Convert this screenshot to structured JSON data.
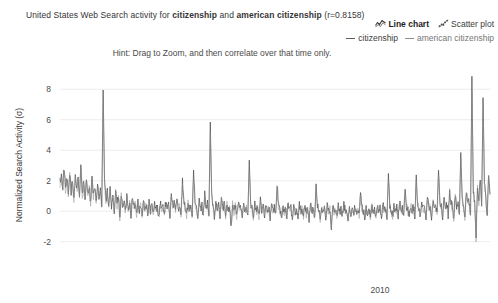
{
  "header": {
    "title_prefix": "United States Web Search activity for ",
    "term_a": "citizenship",
    "title_join": " and ",
    "term_b": "american citizenship",
    "correlation_text": " (r=0.8158)",
    "hint": "Hint: Drag to Zoom, and then correlate over that time only."
  },
  "view_toggle": {
    "line_chart_label": "Line chart",
    "line_chart_icon": "line-chart-icon",
    "scatter_plot_label": "Scatter plot",
    "scatter_plot_icon": "scatter-plot-icon",
    "active": "Line chart"
  },
  "legend": {
    "entries": [
      {
        "label": "citizenship",
        "color": "#5c5c5c"
      },
      {
        "label": "american citizenship",
        "color": "#8f8f8f"
      }
    ]
  },
  "chart_data": {
    "type": "line",
    "title": "United States Web Search activity for citizenship and american citizenship (r=0.8158)",
    "xlabel": "",
    "ylabel": "Normalized Search Activity (σ)",
    "grid": true,
    "legend_position": "top-right",
    "correlation_r": 0.8158,
    "ylim": [
      -3.2,
      9.0
    ],
    "ytick_values": [
      8,
      6,
      4,
      2,
      0,
      -2
    ],
    "ytick_labels": [
      "8",
      "6",
      "4",
      "2",
      "0",
      "-2"
    ],
    "xtick_values": [
      2010
    ],
    "xtick_labels": [
      "2010"
    ],
    "xlim": [
      2003.6,
      2012.2
    ],
    "series": [
      {
        "name": "citizenship",
        "color": "#4a4a4a",
        "values": [
          1.95,
          2.35,
          1.62,
          2.9,
          1.4,
          2.15,
          1.05,
          2.55,
          1.3,
          2.0,
          0.85,
          2.45,
          1.5,
          2.1,
          0.95,
          3.05,
          1.25,
          1.85,
          0.7,
          2.3,
          1.1,
          1.7,
          0.55,
          2.25,
          1.0,
          1.55,
          0.45,
          1.9,
          0.8,
          1.45,
          0.3,
          7.95,
          2.2,
          0.6,
          1.35,
          0.15,
          1.6,
          0.4,
          1.15,
          -0.2,
          1.45,
          0.5,
          0.95,
          -0.45,
          1.05,
          0.25,
          0.75,
          -0.15,
          0.9,
          0.1,
          0.6,
          -0.3,
          0.85,
          0.2,
          0.5,
          -0.1,
          0.7,
          0.0,
          0.45,
          -0.35,
          0.65,
          0.15,
          0.4,
          -0.25,
          0.55,
          0.05,
          0.35,
          -0.2,
          0.5,
          0.1,
          0.3,
          -0.4,
          0.6,
          0.2,
          0.35,
          -0.15,
          0.55,
          0.05,
          0.4,
          -0.3,
          1.25,
          0.35,
          0.55,
          0.0,
          0.75,
          0.15,
          0.45,
          -0.2,
          1.95,
          0.5,
          0.3,
          -0.35,
          0.6,
          0.1,
          0.4,
          -0.25,
          2.65,
          0.55,
          0.2,
          -0.45,
          0.7,
          0.15,
          0.35,
          -0.2,
          1.15,
          0.3,
          0.5,
          -0.3,
          5.85,
          1.05,
          0.25,
          -0.5,
          0.6,
          0.05,
          0.4,
          -0.35,
          0.85,
          0.2,
          0.45,
          -0.25,
          0.65,
          0.1,
          0.3,
          -1.15,
          0.5,
          0.0,
          0.35,
          -0.3,
          0.55,
          0.15,
          0.25,
          -0.45,
          0.6,
          0.05,
          0.3,
          -0.25,
          3.35,
          0.6,
          0.15,
          -0.4,
          0.45,
          0.0,
          0.25,
          -0.3,
          0.7,
          0.1,
          0.35,
          -0.2,
          0.5,
          -0.05,
          0.3,
          -0.55,
          0.45,
          0.05,
          0.2,
          -0.35,
          1.85,
          0.4,
          0.1,
          -0.45,
          0.35,
          -0.1,
          0.25,
          -0.3,
          0.55,
          0.0,
          0.2,
          -0.55,
          0.4,
          -0.05,
          0.15,
          -0.4,
          0.5,
          0.05,
          0.2,
          -0.3,
          0.35,
          -0.15,
          0.25,
          -0.5,
          0.45,
          0.0,
          0.15,
          -0.35,
          1.55,
          0.3,
          0.05,
          -0.45,
          0.3,
          -0.1,
          0.2,
          -0.35,
          0.4,
          -0.05,
          0.15,
          -1.35,
          0.35,
          0.0,
          0.1,
          -0.4,
          0.3,
          -0.1,
          0.2,
          -0.3,
          0.45,
          0.05,
          0.1,
          -0.45,
          0.25,
          -0.15,
          0.2,
          -0.35,
          0.4,
          0.0,
          0.1,
          -0.3,
          1.25,
          0.25,
          0.05,
          -0.4,
          0.2,
          -0.1,
          0.15,
          -0.35,
          0.35,
          -0.05,
          0.1,
          -0.45,
          0.3,
          0.0,
          0.15,
          -0.3,
          0.45,
          0.05,
          0.2,
          -0.35,
          2.45,
          0.35,
          0.1,
          -0.4,
          0.35,
          0.0,
          0.2,
          -0.3,
          0.55,
          0.1,
          0.25,
          -0.35,
          1.35,
          0.3,
          0.15,
          -0.45,
          0.45,
          0.05,
          0.25,
          -0.25,
          2.15,
          0.4,
          0.2,
          -0.35,
          0.55,
          0.15,
          0.3,
          -0.3,
          1.05,
          0.35,
          0.25,
          -0.45,
          0.65,
          0.2,
          0.35,
          -0.25,
          2.95,
          0.6,
          0.3,
          -0.35,
          0.85,
          0.25,
          0.45,
          -0.3,
          1.45,
          0.5,
          0.35,
          -0.4,
          1.05,
          0.35,
          0.55,
          -0.2,
          3.85,
          0.95,
          0.4,
          -0.45,
          1.25,
          0.45,
          0.65,
          -0.25,
          8.85,
          1.45,
          0.55,
          -1.55,
          1.65,
          0.65,
          2.15,
          0.35,
          7.45,
          1.95,
          0.85,
          -0.35,
          2.35,
          1.15
        ]
      },
      {
        "name": "american citizenship",
        "color": "#8a8a8a",
        "values": [
          1.75,
          2.15,
          1.45,
          2.6,
          1.25,
          1.95,
          0.95,
          2.3,
          1.15,
          1.8,
          0.75,
          2.2,
          1.35,
          1.9,
          0.85,
          2.75,
          1.1,
          1.65,
          0.6,
          2.05,
          1.0,
          1.5,
          0.45,
          2.0,
          0.9,
          1.4,
          0.35,
          1.7,
          0.7,
          1.3,
          0.25,
          6.95,
          1.95,
          0.5,
          1.2,
          0.1,
          1.45,
          0.3,
          1.0,
          -0.25,
          1.3,
          0.4,
          0.85,
          -0.5,
          0.95,
          0.2,
          0.65,
          -0.2,
          0.8,
          0.05,
          0.5,
          -0.35,
          0.75,
          0.15,
          0.4,
          -0.15,
          0.6,
          -0.05,
          0.4,
          -0.4,
          0.55,
          0.1,
          0.35,
          -0.3,
          0.45,
          0.0,
          0.3,
          -0.25,
          0.45,
          0.05,
          0.25,
          -0.45,
          0.5,
          0.15,
          0.3,
          -0.2,
          0.45,
          0.0,
          0.35,
          -0.35,
          1.1,
          0.3,
          0.45,
          -0.05,
          0.65,
          0.1,
          0.4,
          -0.25,
          1.7,
          0.45,
          0.25,
          -0.4,
          0.5,
          0.05,
          0.35,
          -0.3,
          2.35,
          0.45,
          0.15,
          -0.5,
          0.6,
          0.1,
          0.3,
          -0.25,
          1.0,
          0.25,
          0.4,
          -0.35,
          5.15,
          0.95,
          0.2,
          -0.55,
          0.5,
          0.0,
          0.35,
          -0.4,
          0.75,
          0.15,
          0.4,
          -0.3,
          0.55,
          0.05,
          0.25,
          -1.0,
          0.45,
          -0.05,
          0.3,
          -0.35,
          0.45,
          0.1,
          0.2,
          -0.5,
          0.5,
          0.0,
          0.25,
          -0.3,
          2.95,
          0.5,
          0.1,
          -0.45,
          0.4,
          -0.05,
          0.2,
          -0.35,
          0.6,
          0.05,
          0.3,
          -0.25,
          0.45,
          -0.1,
          0.25,
          -0.6,
          0.4,
          0.0,
          0.15,
          -0.4,
          1.6,
          0.35,
          0.05,
          -0.5,
          0.3,
          -0.15,
          0.2,
          -0.35,
          0.45,
          -0.05,
          0.15,
          -0.6,
          0.35,
          -0.1,
          0.1,
          -0.45,
          0.45,
          0.0,
          0.15,
          -0.35,
          0.3,
          -0.2,
          0.2,
          -0.55,
          0.4,
          -0.05,
          0.1,
          -0.4,
          1.35,
          0.25,
          0.0,
          -0.5,
          0.25,
          -0.15,
          0.15,
          -0.4,
          0.35,
          -0.1,
          0.1,
          -1.2,
          0.3,
          -0.05,
          0.05,
          -0.45,
          0.25,
          -0.15,
          0.15,
          -0.35,
          0.4,
          0.0,
          0.05,
          -0.5,
          0.2,
          -0.2,
          0.15,
          -0.4,
          0.35,
          -0.05,
          0.05,
          -0.35,
          1.1,
          0.2,
          0.0,
          -0.45,
          0.15,
          -0.15,
          0.1,
          -0.4,
          0.3,
          -0.1,
          0.05,
          -0.5,
          0.25,
          -0.05,
          0.1,
          -0.35,
          0.4,
          0.0,
          0.15,
          -0.4,
          2.15,
          0.3,
          0.05,
          -0.45,
          0.3,
          -0.05,
          0.15,
          -0.35,
          0.5,
          0.05,
          0.2,
          -0.4,
          1.2,
          0.25,
          0.1,
          -0.5,
          0.4,
          0.0,
          0.2,
          -0.3,
          1.9,
          0.35,
          0.15,
          -0.4,
          0.5,
          0.1,
          0.25,
          -0.35,
          0.95,
          0.3,
          0.2,
          -0.5,
          0.55,
          0.15,
          0.3,
          -0.3,
          2.6,
          0.5,
          0.25,
          -0.4,
          0.75,
          0.2,
          0.4,
          -0.35,
          1.3,
          0.45,
          0.3,
          -0.45,
          0.95,
          0.3,
          0.5,
          -0.25,
          3.45,
          0.85,
          0.35,
          -0.5,
          1.1,
          0.4,
          0.6,
          -0.3,
          7.85,
          1.3,
          0.5,
          -1.75,
          1.5,
          0.6,
          1.95,
          0.3,
          6.55,
          1.75,
          0.75,
          -0.4,
          2.1,
          1.05
        ]
      }
    ]
  }
}
